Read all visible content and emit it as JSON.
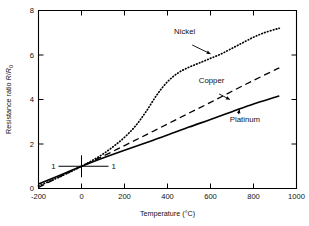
{
  "chart_data": {
    "type": "line",
    "title": "",
    "xlabel": "Temperature (°C)",
    "ylabel": "Resistance ratio R/R0",
    "ylabel_parts": {
      "prefix": "Resistance ratio ",
      "sym1": "R",
      "slash": "/",
      "sym2": "R",
      "sub": "0"
    },
    "xlim": [
      -200,
      1000
    ],
    "ylim": [
      0,
      8
    ],
    "xticks": [
      -200,
      0,
      200,
      400,
      600,
      800,
      1000
    ],
    "yticks": [
      0,
      2,
      4,
      6,
      8
    ],
    "xtick_labels": [
      "-200",
      "0",
      "200",
      "400",
      "600",
      "800",
      "1000"
    ],
    "ytick_labels": [
      "0",
      "2",
      "4",
      "6",
      "8"
    ],
    "grid": false,
    "legend_position": "inline-annotations",
    "units": {
      "x": "°C",
      "y": "ratio"
    },
    "annotations": [
      {
        "name": "reference-left",
        "text": "1",
        "x": -120,
        "y": 1.0,
        "note": "leader line to crossing point at (0,1)"
      },
      {
        "name": "reference-right",
        "text": "1",
        "x": 160,
        "y": 1.0,
        "note": "leader line to crossing point at (0,1)"
      },
      {
        "name": "origin-marker",
        "text": "",
        "x": 0,
        "y": 1.0,
        "note": "short vertical tick through the common crossing point"
      }
    ],
    "series": [
      {
        "name": "Nickel",
        "style": "dotted",
        "color": "#000000",
        "label_x": 480,
        "label_y": 6.95,
        "arrow_to_x": 600,
        "arrow_to_y": 6.05,
        "x": [
          -200,
          -150,
          -100,
          -50,
          0,
          50,
          100,
          150,
          200,
          250,
          300,
          350,
          400,
          450,
          500,
          550,
          600,
          650,
          700,
          750,
          800,
          850,
          900,
          920
        ],
        "y": [
          0.12,
          0.32,
          0.53,
          0.76,
          1.0,
          1.26,
          1.55,
          1.9,
          2.3,
          2.8,
          3.45,
          4.2,
          4.8,
          5.2,
          5.45,
          5.65,
          5.85,
          6.05,
          6.3,
          6.55,
          6.8,
          7.0,
          7.15,
          7.2
        ]
      },
      {
        "name": "Copper",
        "style": "dashed",
        "color": "#000000",
        "label_x": 605,
        "label_y": 4.75,
        "arrow_to_x": 690,
        "arrow_to_y": 4.0,
        "x": [
          -200,
          -100,
          0,
          100,
          200,
          300,
          400,
          500,
          600,
          700,
          800,
          900,
          920
        ],
        "y": [
          0.05,
          0.53,
          1.0,
          1.45,
          1.93,
          2.41,
          2.9,
          3.39,
          3.87,
          4.37,
          4.86,
          5.33,
          5.42
        ]
      },
      {
        "name": "Platinum",
        "style": "solid",
        "color": "#000000",
        "label_x": 760,
        "label_y": 3.0,
        "arrow_to_x": 735,
        "arrow_to_y": 3.55,
        "x": [
          -200,
          -100,
          0,
          100,
          200,
          300,
          400,
          500,
          600,
          700,
          800,
          900,
          920
        ],
        "y": [
          0.2,
          0.6,
          1.0,
          1.37,
          1.72,
          2.06,
          2.4,
          2.76,
          3.1,
          3.45,
          3.8,
          4.1,
          4.16
        ]
      }
    ]
  }
}
